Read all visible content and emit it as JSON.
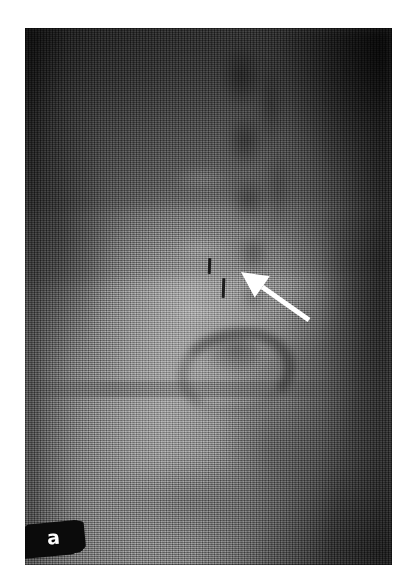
{
  "figure": {
    "panel_label": "a",
    "modality": "radiograph",
    "view_description": "lateral lumbar spine radiograph",
    "background_color": "#ffffff",
    "plate": {
      "left": 25,
      "top": 28,
      "width": 367,
      "height": 537,
      "base_color": "#4a4a4a",
      "darkest_tone": "#232323",
      "brightest_tone": "#9a9a9a"
    }
  },
  "panel_label_box": {
    "glyph": "a",
    "text_color": "#fdfdfd",
    "box_color": "#0b0b0b",
    "rotation_degrees": -5.5
  },
  "annotation": {
    "arrow": {
      "name": "pointer-arrow",
      "color": "#ffffff",
      "tip_x": 216,
      "tip_y": 244,
      "tail_x": 284,
      "tail_y": 292,
      "direction": "up-left",
      "head_length": 26,
      "head_half_width": 13,
      "shaft_width": 5
    },
    "markers": [
      {
        "name": "fiducial-tick-upper",
        "x": 183,
        "y": 230,
        "width": 3,
        "height": 16,
        "color": "#1b1b1b"
      },
      {
        "name": "fiducial-tick-lower",
        "x": 197,
        "y": 250,
        "width": 3,
        "height": 20,
        "color": "#1b1b1b"
      }
    ]
  },
  "anatomy_regions": [
    {
      "name": "posterior-vertebral-elements",
      "tone": "dark",
      "location": "upper-centre-right"
    },
    {
      "name": "spinous-process-column",
      "tone": "dark",
      "location": "upper-right-of-centre"
    },
    {
      "name": "vertebral-body-column",
      "tone": "bright",
      "location": "centre"
    },
    {
      "name": "ring-shadow-structure",
      "tone": "dark",
      "location": "lower-centre"
    },
    {
      "name": "soft-tissue-field",
      "tone": "mid-grey",
      "location": "left-and-lower"
    },
    {
      "name": "air-background",
      "tone": "very-dark",
      "location": "upper-right-and-right-margin"
    }
  ]
}
